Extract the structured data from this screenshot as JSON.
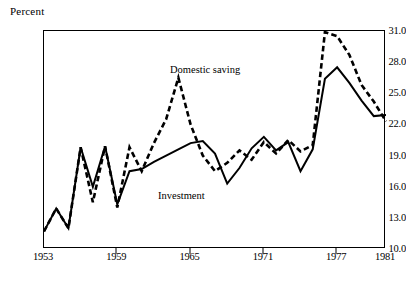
{
  "axis_title": "Percent",
  "labels": {
    "saving": "Domestic saving",
    "investment": "Investment"
  },
  "chart_data": {
    "type": "line",
    "title": "",
    "xlabel": "",
    "ylabel": "Percent",
    "ylim": [
      10.0,
      31.0
    ],
    "xlim": [
      1953,
      1981
    ],
    "grid": false,
    "legend": "inline-annotations",
    "ytick_labels": [
      "31.0",
      "28.0",
      "25.0",
      "22.0",
      "19.0",
      "16.0",
      "13.0",
      "10.0"
    ],
    "ytick_values": [
      31.0,
      28.0,
      25.0,
      22.0,
      19.0,
      16.0,
      13.0,
      10.0
    ],
    "xtick_labels": [
      "1953",
      "1959",
      "1965",
      "1971",
      "1977",
      "1981"
    ],
    "xtick_values": [
      1953,
      1959,
      1965,
      1971,
      1977,
      1981
    ],
    "x": [
      1953,
      1954,
      1955,
      1956,
      1957,
      1958,
      1959,
      1960,
      1961,
      1962,
      1963,
      1964,
      1965,
      1966,
      1967,
      1968,
      1969,
      1970,
      1971,
      1972,
      1973,
      1974,
      1975,
      1976,
      1977,
      1978,
      1979,
      1980,
      1981
    ],
    "series": [
      {
        "name": "Domestic saving",
        "style": "dashed",
        "color": "#000000",
        "values": [
          11.7,
          13.9,
          12.0,
          19.8,
          14.5,
          19.9,
          14.0,
          19.8,
          17.5,
          20.2,
          22.5,
          26.5,
          22.0,
          19.0,
          17.5,
          18.3,
          19.5,
          18.6,
          20.3,
          19.2,
          20.5,
          19.4,
          20.0,
          30.9,
          30.5,
          28.7,
          25.8,
          24.2,
          22.3
        ]
      },
      {
        "name": "Investment",
        "style": "solid",
        "color": "#000000",
        "values": [
          11.7,
          13.9,
          12.0,
          19.8,
          16.0,
          19.9,
          14.3,
          17.5,
          17.7,
          18.4,
          19.0,
          19.6,
          20.2,
          20.4,
          19.2,
          16.3,
          17.8,
          19.7,
          20.8,
          19.5,
          20.3,
          17.5,
          19.6,
          26.4,
          27.5,
          26.0,
          24.3,
          22.8,
          22.9
        ]
      }
    ]
  }
}
